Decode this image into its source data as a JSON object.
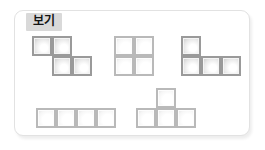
{
  "panel": {
    "tab_label": "보기",
    "background_color": "#ffffff",
    "border_color": "#e2e2e2",
    "tab_background_color": "#d9d9d9",
    "tab_text_color": "#141414"
  },
  "legend": {
    "cell_border_color": "#9a9a9a",
    "cell_light_border_color": "#b9b9b9",
    "cell_fill_light": "#ffffff",
    "cell_fill_shade": "#c9c9c9"
  },
  "chart_data": {
    "type": "diagram",
    "title": "보기",
    "cell_size_px": 20,
    "shapes": [
      {
        "name": "s-tetromino",
        "label": "S",
        "style": "dark",
        "rows": 2,
        "cols": 3,
        "grid": [
          [
            1,
            1,
            0
          ],
          [
            0,
            1,
            1
          ]
        ],
        "cell_count": 4,
        "position": {
          "x": 32,
          "y": 36
        }
      },
      {
        "name": "o-tetromino",
        "label": "O",
        "style": "light",
        "rows": 2,
        "cols": 2,
        "grid": [
          [
            1,
            1
          ],
          [
            1,
            1
          ]
        ],
        "cell_count": 4,
        "position": {
          "x": 114,
          "y": 36
        }
      },
      {
        "name": "j-tetromino",
        "label": "J",
        "style": "dark",
        "rows": 2,
        "cols": 3,
        "grid": [
          [
            1,
            0,
            0
          ],
          [
            1,
            1,
            1
          ]
        ],
        "cell_count": 4,
        "position": {
          "x": 181,
          "y": 36
        }
      },
      {
        "name": "i-tetromino",
        "label": "I",
        "style": "light",
        "rows": 1,
        "cols": 4,
        "grid": [
          [
            1,
            1,
            1,
            1
          ]
        ],
        "cell_count": 4,
        "position": {
          "x": 36,
          "y": 108
        }
      },
      {
        "name": "t-tetromino",
        "label": "T",
        "style": "light",
        "rows": 2,
        "cols": 3,
        "grid": [
          [
            0,
            1,
            0
          ],
          [
            1,
            1,
            1
          ]
        ],
        "cell_count": 4,
        "position": {
          "x": 136,
          "y": 88
        }
      }
    ]
  }
}
